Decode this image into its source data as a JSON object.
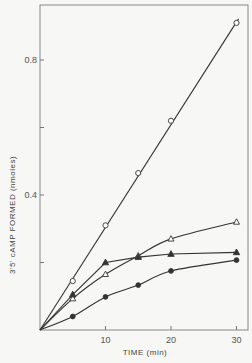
{
  "chart_data": {
    "type": "line",
    "title": "",
    "xlabel": "TIME (min)",
    "ylabel": "3'5' cAMP FORMED (nmoles)",
    "xlim": [
      0,
      31
    ],
    "ylim": [
      0,
      0.96
    ],
    "x_ticks": [
      {
        "value": 10,
        "label": "10"
      },
      {
        "value": 20,
        "label": "20"
      },
      {
        "value": 30,
        "label": "30"
      }
    ],
    "y_ticks": [
      {
        "value": 0.2,
        "label": ""
      },
      {
        "value": 0.4,
        "label": "0.4"
      },
      {
        "value": 0.6,
        "label": ""
      },
      {
        "value": 0.8,
        "label": "0.8"
      }
    ],
    "grid": false,
    "legend": null,
    "series": [
      {
        "name": "open-circle",
        "marker": "open-circle",
        "fit": "straight",
        "x": [
          0,
          5,
          10,
          15,
          20,
          30
        ],
        "values": [
          0,
          0.145,
          0.31,
          0.465,
          0.62,
          0.91
        ]
      },
      {
        "name": "open-triangle",
        "marker": "open-triangle",
        "fit": "curve",
        "x": [
          0,
          5,
          10,
          15,
          20,
          30
        ],
        "values": [
          0,
          0.093,
          0.165,
          0.22,
          0.27,
          0.32
        ]
      },
      {
        "name": "filled-triangle",
        "marker": "filled-triangle",
        "fit": "segments",
        "x": [
          0,
          5,
          10,
          15,
          20,
          30
        ],
        "values": [
          0,
          0.105,
          0.2,
          0.216,
          0.225,
          0.23
        ]
      },
      {
        "name": "filled-circle",
        "marker": "filled-circle",
        "fit": "curve",
        "x": [
          0,
          5,
          10,
          15,
          20,
          30
        ],
        "values": [
          0,
          0.04,
          0.098,
          0.133,
          0.175,
          0.207
        ]
      }
    ]
  },
  "colors": {
    "ink": "#333333",
    "frame": "#777777",
    "background": "#f7f7f5"
  }
}
